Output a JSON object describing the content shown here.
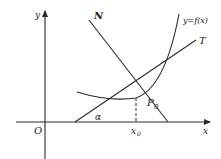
{
  "figure": {
    "labels": {
      "y_axis": "y",
      "x_axis": "x",
      "origin": "O",
      "normal": "N",
      "tangent": "T",
      "curve": "y=f(x)",
      "point": "P",
      "point_subscript": "0",
      "x0": "x",
      "x0_subscript": "0",
      "angle": "α"
    },
    "colors": {
      "ink": "#2a2a2a",
      "background": "#ffffff"
    }
  }
}
